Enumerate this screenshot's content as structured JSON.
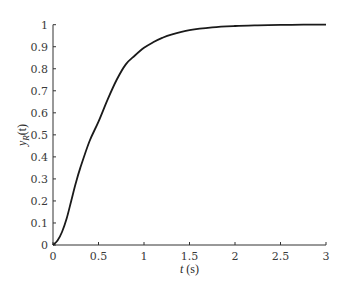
{
  "chart_data": {
    "type": "line",
    "title": "",
    "xlabel": "t (s)",
    "ylabel": "y_R(t)",
    "xlim": [
      0,
      3
    ],
    "ylim": [
      0,
      1
    ],
    "grid": false,
    "legend": null,
    "x_ticks": [
      "0",
      "0.5",
      "1",
      "1.5",
      "2",
      "2.5",
      "3"
    ],
    "y_ticks": [
      "0",
      "0.1",
      "0.2",
      "0.3",
      "0.4",
      "0.5",
      "0.6",
      "0.7",
      "0.8",
      "0.9",
      "1"
    ],
    "series": [
      {
        "name": "y_R(t)",
        "color": "#1a1a1a",
        "x": [
          0,
          0.05,
          0.1,
          0.15,
          0.2,
          0.25,
          0.3,
          0.4,
          0.5,
          0.6,
          0.7,
          0.8,
          0.9,
          1.0,
          1.1,
          1.2,
          1.3,
          1.5,
          1.75,
          2.0,
          2.25,
          2.5,
          2.75,
          3.0
        ],
        "values": [
          0,
          0.02,
          0.06,
          0.12,
          0.2,
          0.28,
          0.35,
          0.47,
          0.56,
          0.66,
          0.75,
          0.82,
          0.86,
          0.895,
          0.92,
          0.94,
          0.955,
          0.975,
          0.988,
          0.994,
          0.997,
          0.999,
          1.0,
          1.0
        ]
      }
    ]
  },
  "axes": {
    "xlabel_italic": "t",
    "xlabel_unit": " (s)",
    "ylabel_main": "y",
    "ylabel_sub": "R",
    "ylabel_arg": "(t)"
  }
}
